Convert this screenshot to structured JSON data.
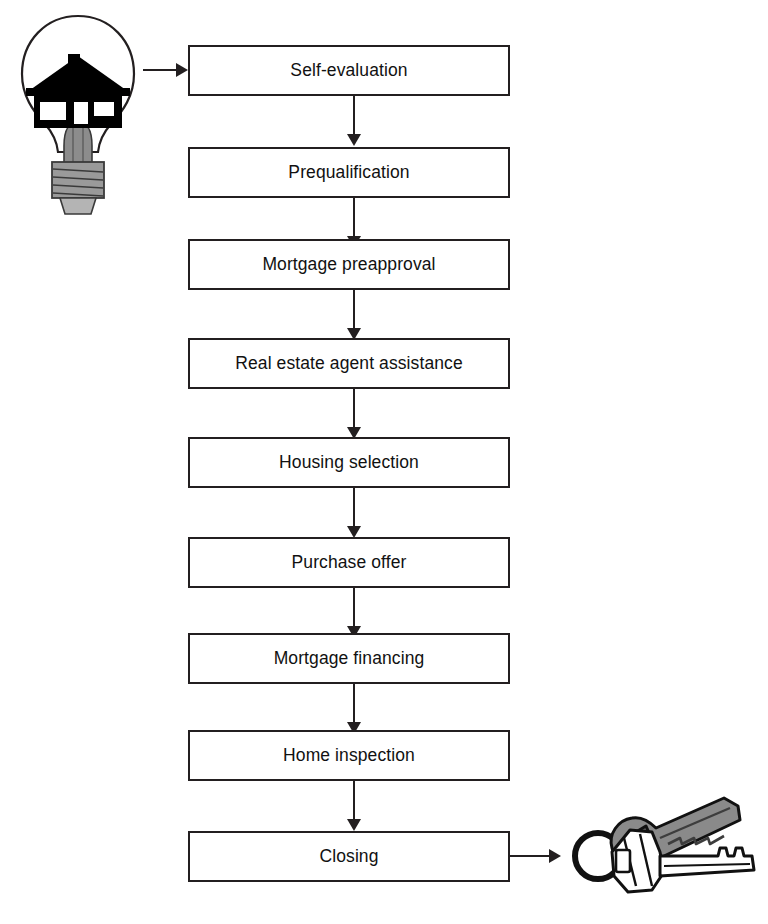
{
  "diagram": {
    "orientation": "vertical",
    "box_fill": "#ffffff",
    "box_stroke": "#231f20",
    "text_color": "#111111",
    "steps": [
      {
        "id": "self-evaluation",
        "label": "Self-evaluation"
      },
      {
        "id": "prequalification",
        "label": "Prequalification"
      },
      {
        "id": "mortgage-preapproval",
        "label": "Mortgage preapproval"
      },
      {
        "id": "real-estate-agent-assistance",
        "label": "Real estate agent assistance"
      },
      {
        "id": "housing-selection",
        "label": "Housing selection"
      },
      {
        "id": "purchase-offer",
        "label": "Purchase offer"
      },
      {
        "id": "mortgage-financing",
        "label": "Mortgage financing"
      },
      {
        "id": "home-inspection",
        "label": "Home inspection"
      },
      {
        "id": "closing",
        "label": "Closing"
      }
    ],
    "icons": {
      "start": {
        "name": "lightbulb-with-house-icon",
        "description": "Light bulb containing a house silhouette",
        "glass_color": "#ffffff",
        "outline_color": "#231f20",
        "house_color": "#000000",
        "base_color": "#8c8c8c"
      },
      "end": {
        "name": "house-keys-icon",
        "description": "Two keys on a key ring",
        "front_key_color": "#ffffff",
        "back_key_color": "#8a8a8a",
        "ring_color": "#111111",
        "outline_color": "#111111"
      }
    },
    "connectors": {
      "entry_arrow": "lightbulb-to-self-evaluation",
      "exit_arrow": "closing-to-keys",
      "between_steps": "downward-arrow",
      "arrow_color": "#231f20"
    }
  }
}
